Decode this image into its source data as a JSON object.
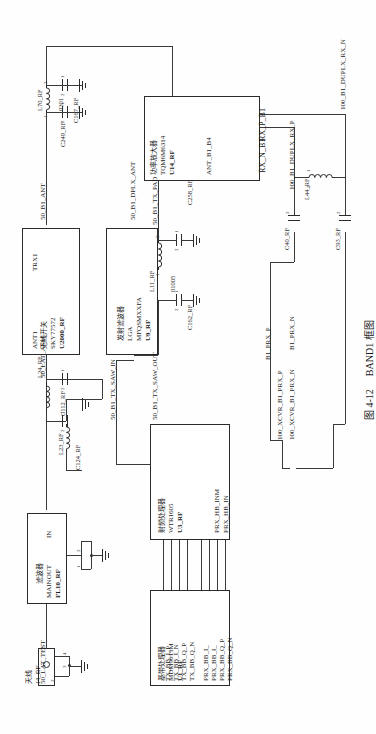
{
  "figure": {
    "caption_number": "图 4-12",
    "caption_title": "BAND1 框图",
    "orientation": "rotated-90"
  },
  "blocks": [
    {
      "id": "u2000",
      "refdes": "U2000_RF",
      "part": "SKY77572",
      "desc": "无线开关",
      "pins_left": [
        "ANT1"
      ],
      "pins_right": [
        "TRX1"
      ]
    },
    {
      "id": "u9",
      "refdes": "U9_RF",
      "part": "MFQSMXXFA",
      "package": "LGA",
      "desc": "发射滤波器"
    },
    {
      "id": "u14",
      "refdes": "U14_RF",
      "part": "TQM6M6314",
      "desc": "功率放大器",
      "pin_ant": "ANT_B1_B4",
      "pins_out": [
        "RX_N_B1",
        "RX_P_B1"
      ]
    },
    {
      "id": "fl10",
      "refdes": "FL10_RF",
      "desc": "滤波器",
      "pin_out": "MAINOUT",
      "pin_in": "IN"
    },
    {
      "id": "u3",
      "refdes": "U3_RF",
      "part": "WTR1605",
      "desc": "射频处理器",
      "pins_rx": [
        "PRX_HB_IN",
        "PRX_HB_INM"
      ]
    },
    {
      "id": "u1",
      "refdes": "U1_RF",
      "part": "MDM9615M",
      "desc": "基带处理器",
      "pins_tx": [
        "TX_BB_I_P",
        "TX_BB_I_N",
        "TX_BB_Q_P",
        "TX_BB_Q_N"
      ],
      "pins_rx": [
        "PRX_BB_I_",
        "PRX_BB_I_",
        "PRX_BB_Q_P",
        "PRX_BB_Q_N"
      ]
    }
  ],
  "antenna": {
    "label": "天线",
    "refdes": "J4_RF",
    "pin_nums": [
      "1",
      "2",
      "3",
      "4"
    ]
  },
  "passives": [
    {
      "id": "l70",
      "refdes": "L70_RF",
      "value": "0201",
      "p1": "1",
      "p2": "2"
    },
    {
      "id": "c249",
      "refdes": "C249_RF",
      "p1": "1",
      "p2": "2"
    },
    {
      "id": "c167",
      "refdes": "C167_RF",
      "p1": "1",
      "p2": "2"
    },
    {
      "id": "c258",
      "refdes": "C258_RF",
      "p1": "1",
      "p2": "2"
    },
    {
      "id": "c162",
      "refdes": "C162_RF",
      "p1": "1",
      "p2": "2"
    },
    {
      "id": "l11",
      "refdes": "L11_RF",
      "value": "01005",
      "p1": "1",
      "p2": "2"
    },
    {
      "id": "c40",
      "refdes": "C40_RF",
      "p1": "1",
      "p2": "2"
    },
    {
      "id": "c93",
      "refdes": "C93_RF",
      "p1": "1",
      "p2": "2"
    },
    {
      "id": "l44",
      "refdes": "L44_RF",
      "p1": "1",
      "p2": "2"
    },
    {
      "id": "l24",
      "refdes": "L24_RF",
      "p1": "1",
      "p2": "2"
    },
    {
      "id": "l23",
      "refdes": "L23_RF",
      "p1": "1",
      "p2": "2"
    },
    {
      "id": "c112",
      "refdes": "C112_RF",
      "p1": "1",
      "p2": "2"
    },
    {
      "id": "c124",
      "refdes": "C124_RF",
      "p1": "1",
      "p2": "2"
    }
  ],
  "nets": {
    "b1_ant": "50_B1_ANT",
    "b1_dplx_ant": "50_B1_DPLX_ANT",
    "b1_tx_pad": "50_B1_TX_PAD",
    "b1_tx_saw_out": "50_B1_TX_SAW_OUT",
    "b1_tx_saw_in": "50_B1_TX_SAW_IN",
    "lat_asm": "50_LAT_ASM",
    "lat_test": "50_LAT_TEST",
    "duplx_rx_n": "100_B1_DUPLX_RX_N",
    "duplx_rx_p": "100_B1_DUPLX_RX_P",
    "xcvr_prx_p": "100_XCVR_B1_PRX_P",
    "xcvr_prx_n": "100_XCVR_B1_PRX_N",
    "b1_prx_p": "B1_PRX_P",
    "b1_prx_n": "B1_PRX_N"
  },
  "colors": {
    "ink": "#2b2b2b",
    "wire": "#3a3a3a",
    "paper": "#fefefe"
  }
}
